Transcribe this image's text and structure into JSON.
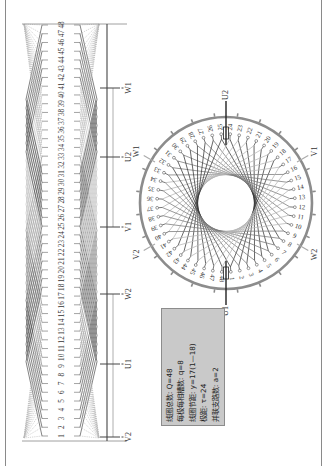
{
  "figure": {
    "type": "motor-winding-diagram",
    "colors": {
      "frame": "#8a8a8a",
      "coil_dark": "#3a3a3a",
      "coil_mid": "#7a7a7a",
      "coil_light": "#b8b8b8",
      "ring": "#8c8c8c",
      "lead": "#444444",
      "infobox_bg": "#c9c9c9"
    }
  },
  "linear_diagram": {
    "slot_count": 48,
    "slot_labels": [
      "1",
      "2",
      "3",
      "4",
      "5",
      "6",
      "7",
      "8",
      "9",
      "10",
      "11",
      "12",
      "13",
      "14",
      "15",
      "16",
      "17",
      "18",
      "19",
      "20",
      "21",
      "22",
      "23",
      "24",
      "25",
      "26",
      "27",
      "28",
      "29",
      "30",
      "31",
      "32",
      "33",
      "34",
      "35",
      "36",
      "37",
      "38",
      "39",
      "40",
      "41",
      "42",
      "43",
      "44",
      "45",
      "46",
      "47",
      "48"
    ],
    "terminals": [
      {
        "label": "W1",
        "y": 88
      },
      {
        "label": "U2",
        "y": 157
      },
      {
        "label": "V1",
        "y": 227
      },
      {
        "label": "W2",
        "y": 294
      },
      {
        "label": "U1",
        "y": 364
      },
      {
        "label": "V2",
        "y": 437
      }
    ]
  },
  "circle_diagram": {
    "center": [
      226,
      203
    ],
    "radius": 86,
    "slot_labels": [
      "1",
      "2",
      "3",
      "4",
      "5",
      "6",
      "7",
      "8",
      "9",
      "10",
      "11",
      "12",
      "13",
      "14",
      "15",
      "16",
      "17",
      "18",
      "19",
      "20",
      "21",
      "22",
      "23",
      "24",
      "25",
      "26",
      "27",
      "28",
      "29",
      "30",
      "31",
      "32",
      "33",
      "34",
      "35",
      "36",
      "37",
      "38",
      "39",
      "40",
      "41",
      "42",
      "43",
      "44",
      "45",
      "46",
      "47",
      "48"
    ],
    "terminals": [
      {
        "label": "U2",
        "angle": 90
      },
      {
        "label": "V1",
        "angle": 30
      },
      {
        "label": "W2",
        "angle": -30
      },
      {
        "label": "U1",
        "angle": -90
      },
      {
        "label": "V2",
        "angle": -150
      },
      {
        "label": "W1",
        "angle": 150
      }
    ]
  },
  "info_box": {
    "lines": [
      "线圈总数: Q=48",
      "每极每相槽数: q=8",
      "线圈节距: y=17(1—18)",
      "极距: τ=24",
      "并联支路数: a=2"
    ]
  }
}
